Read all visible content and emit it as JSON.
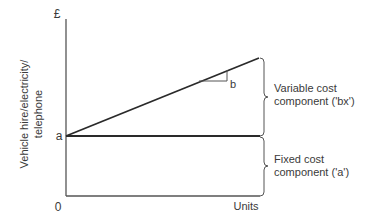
{
  "diagram": {
    "y_axis_label_line1": "Vehicle hire/electricity/",
    "y_axis_label_line2": "telephone",
    "y_axis_unit": "£",
    "x_axis_label": "Units",
    "origin_label": "0",
    "intercept_label": "a",
    "slope_label": "b",
    "variable_component_line1": "Variable cost",
    "variable_component_line2": "component ('bx')",
    "fixed_component_line1": "Fixed cost",
    "fixed_component_line2": "component ('a')"
  }
}
